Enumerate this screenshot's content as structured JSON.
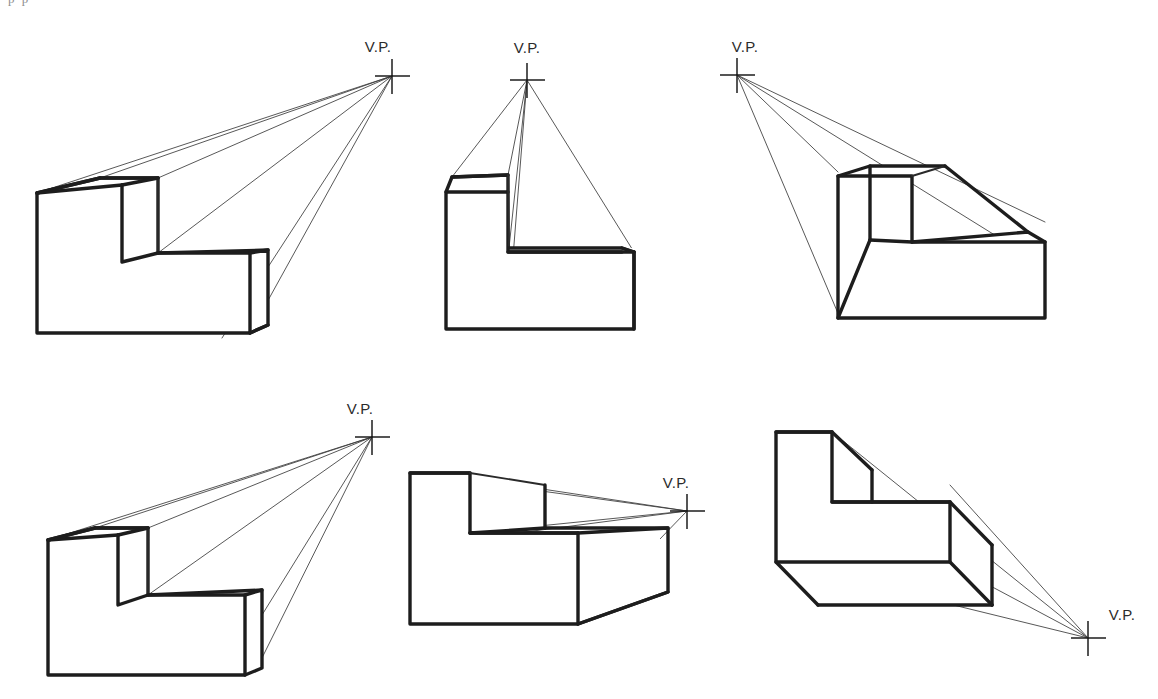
{
  "page": {
    "background_color": "#ffffff",
    "line_color": "#1d1d1d",
    "projector_color": "#3a3a3a",
    "cropped_header_text": "p  p"
  },
  "figures": [
    {
      "id": "figure-1",
      "position": "top-left",
      "vp_label": "V.P.",
      "vp_label_anchor": "above-left",
      "vp_point": {
        "x": 392,
        "y": 76
      },
      "vp_relation": "upper-right, far from object",
      "object_shape": "L-block",
      "projector_count": 5
    },
    {
      "id": "figure-2",
      "position": "top-center",
      "vp_label": "V.P.",
      "vp_label_anchor": "above",
      "vp_point": {
        "x": 527,
        "y": 80
      },
      "vp_relation": "directly above object",
      "object_shape": "L-block",
      "projector_count": 5
    },
    {
      "id": "figure-3",
      "position": "top-right",
      "vp_label": "V.P.",
      "vp_label_anchor": "above-right",
      "vp_point": {
        "x": 737,
        "y": 75
      },
      "vp_relation": "upper-left, far from object",
      "object_shape": "L-block",
      "projector_count": 4
    },
    {
      "id": "figure-4",
      "position": "bottom-left",
      "vp_label": "V.P.",
      "vp_label_anchor": "above-left",
      "vp_point": {
        "x": 372,
        "y": 437
      },
      "vp_relation": "upper-right of object",
      "object_shape": "L-block",
      "projector_count": 5
    },
    {
      "id": "figure-5",
      "position": "bottom-center",
      "vp_label": "V.P.",
      "vp_label_anchor": "above-left",
      "vp_point": {
        "x": 687,
        "y": 511
      },
      "vp_relation": "right of object at mid height",
      "object_shape": "L-block",
      "projector_count": 5
    },
    {
      "id": "figure-6",
      "position": "bottom-right",
      "vp_label": "V.P.",
      "vp_label_anchor": "above-right",
      "vp_point": {
        "x": 1088,
        "y": 638
      },
      "vp_relation": "lower-right, below object",
      "object_shape": "L-block",
      "projector_count": 4
    }
  ]
}
